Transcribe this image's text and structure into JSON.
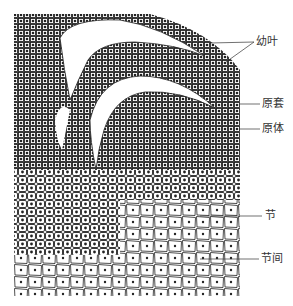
{
  "figure": {
    "colors": {
      "ink": "#2a2a2a",
      "background": "#ffffff"
    }
  },
  "labels": [
    {
      "id": "young-leaf",
      "text": "幼叶",
      "x": 256,
      "y": 36
    },
    {
      "id": "tunica",
      "text": "原套",
      "x": 262,
      "y": 98
    },
    {
      "id": "corpus",
      "text": "原体",
      "x": 262,
      "y": 123
    },
    {
      "id": "node",
      "text": "节",
      "x": 265,
      "y": 210
    },
    {
      "id": "internode",
      "text": "节间",
      "x": 261,
      "y": 253
    }
  ]
}
